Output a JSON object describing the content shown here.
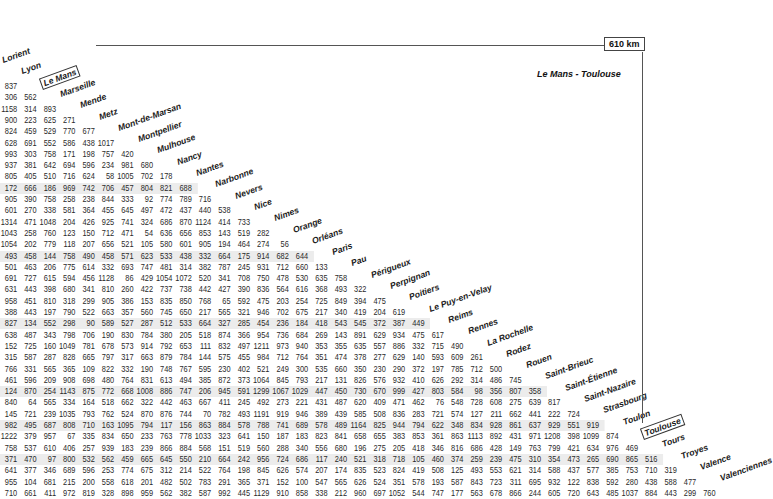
{
  "cities": [
    "Lorient",
    "Lyon",
    "Le Mans",
    "Marseille",
    "Mende",
    "Metz",
    "Mont-de-Marsan",
    "Montpellier",
    "Mulhouse",
    "Nancy",
    "Nantes",
    "Narbonne",
    "Nevers",
    "Nice",
    "Nimes",
    "Orange",
    "Orléans",
    "Paris",
    "Pau",
    "Périgueux",
    "Perpignan",
    "Poitiers",
    "Le Puy-en-Velay",
    "Reims",
    "Rennes",
    "La Rochelle",
    "Rodez",
    "Rouen",
    "Saint-Brieuc",
    "Saint-Étienne",
    "Saint-Nazaire",
    "Strasbourg",
    "Toulon",
    "Toulouse",
    "Tours",
    "Troyes",
    "Valence",
    "Valenciennes"
  ],
  "highlighted": {
    "from": "Le Mans",
    "to": "Toulouse",
    "distance_label": "610 km",
    "route_label": "Le Mans - Toulouse"
  },
  "colors": {
    "shade": "#ececec",
    "line": "#555555",
    "text": "#2a2a2a"
  },
  "rows": [
    [
      "837"
    ],
    [
      "306",
      "562"
    ],
    [
      "1158",
      "314",
      "893"
    ],
    [
      "900",
      "223",
      "625",
      "271"
    ],
    [
      "824",
      "459",
      "529",
      "770",
      "677"
    ],
    [
      "628",
      "691",
      "552",
      "586",
      "438",
      "1017"
    ],
    [
      "993",
      "303",
      "758",
      "171",
      "198",
      "757",
      "420"
    ],
    [
      "937",
      "381",
      "642",
      "694",
      "596",
      "234",
      "981",
      "680"
    ],
    [
      "805",
      "405",
      "510",
      "716",
      "624",
      "58",
      "1005",
      "702",
      "178"
    ],
    [
      "172",
      "666",
      "186",
      "969",
      "742",
      "706",
      "457",
      "804",
      "821",
      "688"
    ],
    [
      "905",
      "390",
      "758",
      "258",
      "238",
      "844",
      "333",
      "92",
      "774",
      "789",
      "716"
    ],
    [
      "601",
      "270",
      "338",
      "581",
      "364",
      "455",
      "645",
      "497",
      "472",
      "437",
      "440",
      "538"
    ],
    [
      "1314",
      "471",
      "1048",
      "204",
      "426",
      "925",
      "741",
      "324",
      "686",
      "870",
      "1124",
      "414",
      "733"
    ],
    [
      "1043",
      "258",
      "760",
      "123",
      "150",
      "712",
      "471",
      "54",
      "636",
      "656",
      "853",
      "143",
      "519",
      "282"
    ],
    [
      "1054",
      "202",
      "779",
      "118",
      "207",
      "656",
      "521",
      "105",
      "580",
      "601",
      "905",
      "194",
      "464",
      "274",
      "56"
    ],
    [
      "493",
      "458",
      "144",
      "758",
      "490",
      "458",
      "571",
      "623",
      "533",
      "438",
      "332",
      "664",
      "175",
      "914",
      "682",
      "644"
    ],
    [
      "501",
      "463",
      "206",
      "775",
      "614",
      "332",
      "693",
      "747",
      "481",
      "314",
      "382",
      "787",
      "245",
      "931",
      "712",
      "660",
      "133"
    ],
    [
      "691",
      "727",
      "615",
      "594",
      "456",
      "1128",
      "86",
      "429",
      "1054",
      "1072",
      "520",
      "341",
      "708",
      "750",
      "478",
      "530",
      "635",
      "758"
    ],
    [
      "631",
      "443",
      "398",
      "680",
      "341",
      "810",
      "260",
      "422",
      "737",
      "738",
      "442",
      "427",
      "390",
      "836",
      "564",
      "616",
      "368",
      "493",
      "322"
    ],
    [
      "958",
      "451",
      "810",
      "318",
      "299",
      "905",
      "386",
      "153",
      "835",
      "850",
      "768",
      "65",
      "592",
      "475",
      "203",
      "254",
      "725",
      "849",
      "394",
      "475"
    ],
    [
      "388",
      "443",
      "197",
      "790",
      "522",
      "663",
      "357",
      "560",
      "745",
      "650",
      "217",
      "565",
      "321",
      "946",
      "702",
      "675",
      "217",
      "340",
      "419",
      "204",
      "619"
    ],
    [
      "827",
      "134",
      "552",
      "298",
      "90",
      "589",
      "527",
      "287",
      "512",
      "533",
      "664",
      "327",
      "285",
      "454",
      "236",
      "184",
      "418",
      "543",
      "545",
      "372",
      "387",
      "449"
    ],
    [
      "638",
      "487",
      "343",
      "798",
      "706",
      "190",
      "830",
      "784",
      "380",
      "205",
      "518",
      "874",
      "366",
      "954",
      "736",
      "684",
      "269",
      "143",
      "891",
      "629",
      "934",
      "475",
      "617"
    ],
    [
      "152",
      "725",
      "160",
      "1049",
      "781",
      "678",
      "573",
      "914",
      "792",
      "653",
      "111",
      "832",
      "497",
      "1211",
      "973",
      "940",
      "353",
      "355",
      "635",
      "557",
      "886",
      "332",
      "715",
      "490"
    ],
    [
      "315",
      "587",
      "287",
      "828",
      "665",
      "797",
      "317",
      "663",
      "879",
      "784",
      "144",
      "575",
      "455",
      "984",
      "712",
      "764",
      "351",
      "474",
      "378",
      "277",
      "629",
      "140",
      "593",
      "609",
      "261"
    ],
    [
      "766",
      "331",
      "565",
      "365",
      "109",
      "822",
      "332",
      "190",
      "748",
      "767",
      "595",
      "230",
      "402",
      "521",
      "249",
      "300",
      "535",
      "660",
      "350",
      "230",
      "290",
      "372",
      "197",
      "785",
      "712",
      "500"
    ],
    [
      "461",
      "596",
      "209",
      "908",
      "698",
      "480",
      "764",
      "831",
      "613",
      "494",
      "385",
      "872",
      "373",
      "1064",
      "845",
      "793",
      "217",
      "131",
      "826",
      "576",
      "932",
      "410",
      "626",
      "292",
      "314",
      "486",
      "745"
    ],
    [
      "124",
      "870",
      "254",
      "1143",
      "875",
      "772",
      "668",
      "1008",
      "886",
      "747",
      "206",
      "945",
      "591",
      "1299",
      "1067",
      "1029",
      "447",
      "450",
      "730",
      "670",
      "999",
      "427",
      "803",
      "584",
      "98",
      "356",
      "807",
      "358"
    ],
    [
      "840",
      "64",
      "565",
      "334",
      "164",
      "518",
      "662",
      "322",
      "442",
      "463",
      "667",
      "411",
      "245",
      "492",
      "273",
      "221",
      "431",
      "487",
      "620",
      "409",
      "471",
      "462",
      "76",
      "548",
      "728",
      "608",
      "275",
      "639",
      "817"
    ],
    [
      "145",
      "721",
      "239",
      "1035",
      "793",
      "762",
      "524",
      "870",
      "876",
      "744",
      "70",
      "782",
      "493",
      "1191",
      "919",
      "946",
      "389",
      "439",
      "585",
      "508",
      "836",
      "283",
      "721",
      "574",
      "127",
      "211",
      "662",
      "441",
      "222",
      "724"
    ],
    [
      "982",
      "495",
      "687",
      "808",
      "710",
      "163",
      "1095",
      "794",
      "117",
      "156",
      "863",
      "884",
      "578",
      "788",
      "741",
      "689",
      "578",
      "489",
      "1164",
      "825",
      "944",
      "794",
      "622",
      "348",
      "834",
      "928",
      "861",
      "637",
      "929",
      "551",
      "919"
    ],
    [
      "1222",
      "379",
      "957",
      "67",
      "335",
      "834",
      "650",
      "233",
      "763",
      "778",
      "1033",
      "323",
      "641",
      "150",
      "187",
      "183",
      "823",
      "841",
      "658",
      "655",
      "383",
      "853",
      "361",
      "863",
      "1113",
      "892",
      "431",
      "971",
      "1208",
      "398",
      "1099",
      "874"
    ],
    [
      "758",
      "537",
      "610",
      "406",
      "257",
      "939",
      "183",
      "239",
      "866",
      "884",
      "568",
      "151",
      "519",
      "560",
      "288",
      "340",
      "556",
      "680",
      "196",
      "275",
      "205",
      "418",
      "346",
      "816",
      "686",
      "428",
      "149",
      "763",
      "799",
      "421",
      "634",
      "976",
      "469"
    ],
    [
      "371",
      "470",
      "97",
      "800",
      "532",
      "562",
      "459",
      "665",
      "645",
      "550",
      "210",
      "664",
      "242",
      "956",
      "724",
      "686",
      "117",
      "240",
      "521",
      "318",
      "718",
      "105",
      "460",
      "374",
      "259",
      "239",
      "475",
      "310",
      "354",
      "473",
      "265",
      "690",
      "865",
      "516"
    ],
    [
      "641",
      "377",
      "346",
      "689",
      "596",
      "253",
      "774",
      "675",
      "312",
      "214",
      "522",
      "764",
      "198",
      "845",
      "626",
      "574",
      "207",
      "174",
      "835",
      "523",
      "824",
      "419",
      "508",
      "125",
      "493",
      "553",
      "621",
      "314",
      "588",
      "437",
      "577",
      "385",
      "753",
      "710",
      "319"
    ],
    [
      "955",
      "104",
      "681",
      "215",
      "200",
      "558",
      "618",
      "201",
      "482",
      "502",
      "783",
      "291",
      "365",
      "371",
      "152",
      "100",
      "547",
      "565",
      "626",
      "524",
      "351",
      "578",
      "193",
      "587",
      "843",
      "723",
      "311",
      "695",
      "932",
      "122",
      "838",
      "592",
      "280",
      "438",
      "588",
      "477"
    ],
    [
      "710",
      "661",
      "411",
      "972",
      "819",
      "328",
      "898",
      "959",
      "562",
      "382",
      "587",
      "992",
      "445",
      "1129",
      "910",
      "858",
      "338",
      "212",
      "960",
      "697",
      "1052",
      "544",
      "747",
      "177",
      "563",
      "678",
      "866",
      "244",
      "605",
      "720",
      "643",
      "485",
      "1037",
      "884",
      "443",
      "299",
      "760"
    ]
  ]
}
